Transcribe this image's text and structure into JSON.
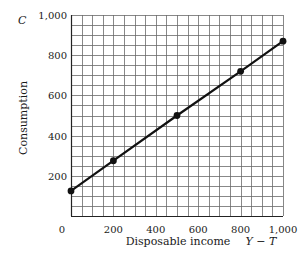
{
  "chart_data": {
    "type": "line",
    "title": "",
    "xlabel": "Disposable income",
    "xlabel_symbol": "Y − T",
    "ylabel": "Consumption",
    "ylabel_symbol": "C",
    "xlim": [
      0,
      1000
    ],
    "ylim": [
      0,
      1000
    ],
    "x_ticks": [
      "0",
      "200",
      "400",
      "600",
      "800",
      "1,000"
    ],
    "y_ticks": [
      "200",
      "400",
      "600",
      "800",
      "1,000"
    ],
    "grid": true,
    "grid_step": 50,
    "legend": null,
    "series": [
      {
        "name": "Consumption function",
        "x": [
          0,
          200,
          500,
          800,
          1000
        ],
        "y": [
          125,
          275,
          500,
          720,
          870
        ],
        "markers": true,
        "color": "#111111"
      }
    ]
  }
}
